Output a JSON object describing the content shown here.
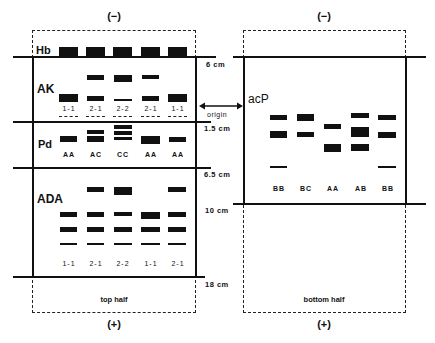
{
  "polarity": {
    "negative": "(−)",
    "positive": "(+)"
  },
  "left_panel": {
    "half_label": "top half",
    "sections": {
      "hb": "Hb",
      "ak": "AK",
      "pd": "Pd",
      "ada": "ADA"
    },
    "ak_phenotypes": [
      "1-1",
      "2-1",
      "2-2",
      "2-1",
      "1-1"
    ],
    "pd_phenotypes": [
      "AA",
      "AC",
      "CC",
      "AA",
      "AA"
    ],
    "ada_phenotypes": [
      "1-1",
      "2-1",
      "2-2",
      "1-1",
      "2-1"
    ]
  },
  "right_panel": {
    "half_label": "bottom half",
    "section": "acP",
    "acp_phenotypes": [
      "BB",
      "BC",
      "AA",
      "AB",
      "BB"
    ]
  },
  "distances": {
    "d6": "6 cm",
    "d1_5": "1.5 cm",
    "d6_5": "6.5 cm",
    "d10": "10 cm",
    "d18": "18 cm"
  },
  "origin_label": "origin",
  "colors": {
    "ink": "#111111",
    "background": "#ffffff"
  }
}
